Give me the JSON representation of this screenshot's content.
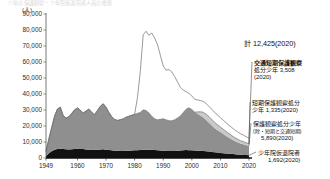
{
  "figure": {
    "top_caption": "少年の保護観察・少年院仮退院者人員の推移",
    "unit": "(人)",
    "total_label": "計 12,425(2020)"
  },
  "annotations": [
    {
      "id": "traffic-short-term",
      "name_line": "交通短期保護観察",
      "value_line": "処分少年 3,508",
      "year_line": "(2020)"
    },
    {
      "id": "short-term",
      "name_line": "短期保護観察処分",
      "value_line": "少年 1,335(2020)",
      "year_line": ""
    },
    {
      "id": "general-probation",
      "name_line": "保護観察処分少年",
      "note_line": "(除・短期と交通短期)",
      "value_line": "5,890(2020)"
    },
    {
      "id": "juvenile-training-school-parolee",
      "name_line": "少年院仮退院者",
      "value_line": "1,692(2020)"
    }
  ],
  "chart_data": {
    "type": "area",
    "title": "少年の保護観察・少年院仮退院者人員の推移",
    "xlabel": "",
    "ylabel": "(人)",
    "unit": "人",
    "stacked": true,
    "grid": false,
    "legend_position": "annotations-right",
    "xlim": [
      1949,
      2020
    ],
    "ylim": [
      0,
      90000
    ],
    "yticks": [
      0,
      10000,
      20000,
      30000,
      40000,
      50000,
      60000,
      70000,
      80000,
      90000
    ],
    "ytick_labels": [
      "0",
      "10,000",
      "20,000",
      "30,000",
      "40,000",
      "50,000",
      "60,000",
      "70,000",
      "80,000",
      "90,000"
    ],
    "xticks": [
      1949,
      1960,
      1970,
      1980,
      1990,
      2000,
      2010,
      2020
    ],
    "xtick_labels": [
      "1949",
      "1960",
      "1970",
      "1980",
      "1990",
      "2000",
      "2010",
      "2020"
    ],
    "series": [
      {
        "name": "少年院仮退院者",
        "fill": "#111111",
        "final_value": 1692,
        "x": [
          1949,
          1950,
          1951,
          1952,
          1953,
          1954,
          1955,
          1956,
          1957,
          1958,
          1959,
          1960,
          1961,
          1962,
          1963,
          1964,
          1965,
          1966,
          1967,
          1968,
          1969,
          1970,
          1971,
          1972,
          1973,
          1974,
          1975,
          1976,
          1977,
          1978,
          1979,
          1980,
          1981,
          1982,
          1983,
          1984,
          1985,
          1986,
          1987,
          1988,
          1989,
          1990,
          1991,
          1992,
          1993,
          1994,
          1995,
          1996,
          1997,
          1998,
          1999,
          2000,
          2001,
          2002,
          2003,
          2004,
          2005,
          2006,
          2007,
          2008,
          2009,
          2010,
          2011,
          2012,
          2013,
          2014,
          2015,
          2016,
          2017,
          2018,
          2019,
          2020
        ],
        "values": [
          1200,
          3000,
          4200,
          5200,
          5600,
          5800,
          5600,
          5400,
          5300,
          5400,
          5600,
          5800,
          5900,
          5600,
          5300,
          5100,
          5000,
          5100,
          5200,
          5300,
          5400,
          5200,
          5000,
          4800,
          4600,
          4500,
          4400,
          4400,
          4500,
          4600,
          4700,
          4800,
          4900,
          5000,
          5100,
          5200,
          5200,
          5100,
          5000,
          4900,
          4700,
          4500,
          4400,
          4300,
          4300,
          4400,
          4500,
          4700,
          4900,
          5000,
          4900,
          4800,
          4700,
          4600,
          4500,
          4400,
          4200,
          4000,
          3800,
          3600,
          3400,
          3200,
          3000,
          2800,
          2700,
          2600,
          2400,
          2200,
          2050,
          1950,
          1800,
          1692
        ]
      },
      {
        "name": "保護観察処分少年(除・短期と交通短期)",
        "fill": "#8f8f8f",
        "final_value": 5890,
        "x": [
          1949,
          1950,
          1951,
          1952,
          1953,
          1954,
          1955,
          1956,
          1957,
          1958,
          1959,
          1960,
          1961,
          1962,
          1963,
          1964,
          1965,
          1966,
          1967,
          1968,
          1969,
          1970,
          1971,
          1972,
          1973,
          1974,
          1975,
          1976,
          1977,
          1978,
          1979,
          1980,
          1981,
          1982,
          1983,
          1984,
          1985,
          1986,
          1987,
          1988,
          1989,
          1990,
          1991,
          1992,
          1993,
          1994,
          1995,
          1996,
          1997,
          1998,
          1999,
          2000,
          2001,
          2002,
          2003,
          2004,
          2005,
          2006,
          2007,
          2008,
          2009,
          2010,
          2011,
          2012,
          2013,
          2014,
          2015,
          2016,
          2017,
          2018,
          2019,
          2020
        ],
        "values": [
          3000,
          9000,
          15000,
          21000,
          25000,
          26000,
          21000,
          19500,
          20500,
          22500,
          24500,
          25500,
          24000,
          22500,
          24000,
          25500,
          23500,
          22000,
          24500,
          27000,
          28500,
          26500,
          23500,
          21000,
          19500,
          19000,
          19500,
          20000,
          21000,
          21500,
          22000,
          22500,
          23000,
          23500,
          25000,
          24500,
          23000,
          21000,
          19500,
          19000,
          19500,
          20000,
          19500,
          19000,
          19000,
          19500,
          20500,
          21500,
          23500,
          25500,
          26500,
          25500,
          24000,
          23000,
          22000,
          21000,
          19500,
          18000,
          16500,
          15000,
          14000,
          13000,
          12000,
          11000,
          10000,
          9000,
          8200,
          7600,
          7000,
          6700,
          6200,
          5890
        ]
      },
      {
        "name": "短期保護観察処分少年",
        "fill": "#c9c9c9",
        "final_value": 1335,
        "x": [
          1949,
          1950,
          1951,
          1952,
          1953,
          1954,
          1955,
          1956,
          1957,
          1958,
          1959,
          1960,
          1961,
          1962,
          1963,
          1964,
          1965,
          1966,
          1967,
          1968,
          1969,
          1970,
          1971,
          1972,
          1973,
          1974,
          1975,
          1976,
          1977,
          1978,
          1979,
          1980,
          1981,
          1982,
          1983,
          1984,
          1985,
          1986,
          1987,
          1988,
          1989,
          1990,
          1991,
          1992,
          1993,
          1994,
          1995,
          1996,
          1997,
          1998,
          1999,
          2000,
          2001,
          2002,
          2003,
          2004,
          2005,
          2006,
          2007,
          2008,
          2009,
          2010,
          2011,
          2012,
          2013,
          2014,
          2015,
          2016,
          2017,
          2018,
          2019,
          2020
        ],
        "values": [
          0,
          0,
          0,
          0,
          0,
          0,
          0,
          0,
          0,
          0,
          0,
          0,
          0,
          0,
          0,
          0,
          0,
          0,
          0,
          0,
          0,
          0,
          0,
          0,
          0,
          0,
          0,
          0,
          0,
          0,
          0,
          0,
          0,
          0,
          0,
          0,
          0,
          0,
          0,
          0,
          0,
          0,
          0,
          0,
          0,
          0,
          0,
          0,
          0,
          0,
          0,
          0,
          0,
          1200,
          2400,
          3200,
          3700,
          3900,
          3800,
          3600,
          3400,
          3200,
          3000,
          2800,
          2600,
          2400,
          2200,
          2000,
          1800,
          1650,
          1500,
          1335
        ]
      },
      {
        "name": "交通短期保護観察処分少年",
        "fill": "#ffffff",
        "stroke": "#6e6e6e",
        "final_value": 3508,
        "x": [
          1949,
          1950,
          1951,
          1952,
          1953,
          1954,
          1955,
          1956,
          1957,
          1958,
          1959,
          1960,
          1961,
          1962,
          1963,
          1964,
          1965,
          1966,
          1967,
          1968,
          1969,
          1970,
          1971,
          1972,
          1973,
          1974,
          1975,
          1976,
          1977,
          1978,
          1979,
          1980,
          1981,
          1982,
          1983,
          1984,
          1985,
          1986,
          1987,
          1988,
          1989,
          1990,
          1991,
          1992,
          1993,
          1994,
          1995,
          1996,
          1997,
          1998,
          1999,
          2000,
          2001,
          2002,
          2003,
          2004,
          2005,
          2006,
          2007,
          2008,
          2009,
          2010,
          2011,
          2012,
          2013,
          2014,
          2015,
          2016,
          2017,
          2018,
          2019,
          2020
        ],
        "values": [
          0,
          0,
          0,
          0,
          0,
          0,
          0,
          0,
          0,
          0,
          0,
          0,
          0,
          0,
          0,
          0,
          0,
          0,
          0,
          0,
          0,
          0,
          0,
          0,
          0,
          0,
          0,
          0,
          0,
          0,
          0,
          0,
          10000,
          26000,
          47000,
          49500,
          48500,
          52000,
          50500,
          47000,
          40000,
          33000,
          31000,
          32000,
          30500,
          27000,
          22500,
          18000,
          14000,
          11000,
          9000,
          8500,
          8000,
          7500,
          7000,
          6800,
          6600,
          6400,
          6300,
          6200,
          6000,
          5800,
          5600,
          5400,
          5200,
          5000,
          4800,
          4600,
          4300,
          4100,
          3800,
          3508
        ]
      }
    ],
    "total_2020": 12425,
    "peak": {
      "year": 1984,
      "value": 80000
    }
  }
}
